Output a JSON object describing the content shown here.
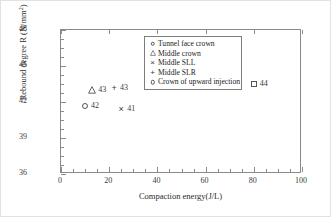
{
  "chart_data": {
    "type": "scatter",
    "title": "",
    "xlabel": "Compaction energy(J/L)",
    "ylabel_main": "Rebound degree R (N/mm",
    "ylabel_sup": "2",
    "ylabel_tail": ")",
    "ylabel_full": "Rebound degree R (N/mm2)",
    "xlim": [
      0,
      100
    ],
    "ylim": [
      36,
      48
    ],
    "xticks": [
      "0",
      "20",
      "40",
      "60",
      "80",
      "100"
    ],
    "xtick_values": [
      0,
      20,
      40,
      60,
      80,
      100
    ],
    "yticks": [
      "36",
      "39",
      "42",
      "45",
      "48"
    ],
    "ytick_values": [
      36,
      39,
      42,
      45,
      48
    ],
    "grid": false,
    "legend_position": "upper center",
    "legend": [
      {
        "marker": "circle-open",
        "label": "Tunnel face crown"
      },
      {
        "marker": "triangle-open",
        "label": "Middle crown"
      },
      {
        "marker": "x-cross",
        "label": "Middle SLL"
      },
      {
        "marker": "plus",
        "label": "Middle SLR"
      },
      {
        "marker": "circle-open",
        "label": "Crown of upward injection"
      }
    ],
    "series": [
      {
        "name": "Tunnel face crown",
        "marker": "circle-open",
        "x": 10,
        "y": 41.7,
        "data_label": "42"
      },
      {
        "name": "Middle crown",
        "marker": "triangle-open",
        "x": 13,
        "y": 43.0,
        "data_label": "43"
      },
      {
        "name": "Middle SLR",
        "marker": "plus",
        "x": 22,
        "y": 43.2,
        "data_label": "43"
      },
      {
        "name": "Middle SLL",
        "marker": "x-cross",
        "x": 25,
        "y": 41.4,
        "data_label": "41"
      },
      {
        "name": "Crown of upward injection",
        "marker": "square-open",
        "x": 80,
        "y": 43.5,
        "data_label": "44"
      }
    ]
  }
}
